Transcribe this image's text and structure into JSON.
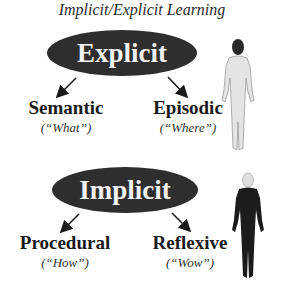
{
  "title": "Implicit/Explicit Learning",
  "explicit": {
    "label": "Explicit",
    "children": [
      {
        "label": "Semantic",
        "sub": "(“What”)"
      },
      {
        "label": "Episodic",
        "sub": "(“Where”)"
      }
    ],
    "figure": "light-human-figure"
  },
  "implicit": {
    "label": "Implicit",
    "children": [
      {
        "label": "Procedural",
        "sub": "(“How”)"
      },
      {
        "label": "Reflexive",
        "sub": "(“Wow”)"
      }
    ],
    "figure": "dark-human-figure"
  },
  "colors": {
    "ellipse": "#2e2e2e",
    "ellipse_text": "#f2f2f2",
    "figure_light": "#e4e4e4",
    "figure_dark": "#1c1c1c"
  }
}
